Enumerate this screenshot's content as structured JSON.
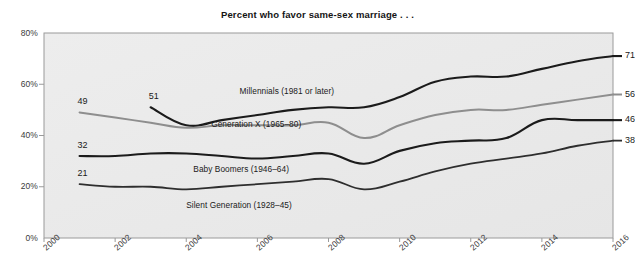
{
  "chart_data": {
    "type": "line",
    "title": "Percent who favor same-sex marriage . . .",
    "xlabel": "",
    "ylabel": "",
    "xlim": [
      2000,
      2016
    ],
    "ylim": [
      0,
      80
    ],
    "grid": false,
    "legend_position": "inline-labels",
    "x_ticks": [
      "2000",
      "2002",
      "2004",
      "2006",
      "2008",
      "2010",
      "2012",
      "2014",
      "2016"
    ],
    "x_tick_values": [
      2000,
      2002,
      2004,
      2006,
      2008,
      2010,
      2012,
      2014,
      2016
    ],
    "y_ticks": [
      "0%",
      "20%",
      "40%",
      "60%",
      "80%"
    ],
    "y_tick_values": [
      0,
      20,
      40,
      60,
      80
    ],
    "series": [
      {
        "name": "Millennials (1981 or later)",
        "label": "Millennials (1981 or later)",
        "color": "#1b1b1b",
        "width": 2.1,
        "start_label": "51",
        "end_label": "71",
        "x": [
          2003,
          2004,
          2005,
          2006,
          2007,
          2008,
          2009,
          2010,
          2011,
          2012,
          2013,
          2014,
          2015,
          2016
        ],
        "values": [
          51,
          44,
          46,
          48,
          50,
          51,
          51,
          55,
          61,
          63,
          63,
          66,
          69,
          71
        ]
      },
      {
        "name": "Generation X (1965-80)",
        "label": "Generation X (1965–80)",
        "color": "#8e8e8e",
        "width": 2.0,
        "start_label": "49",
        "end_label": "56",
        "x": [
          2001,
          2002,
          2003,
          2004,
          2005,
          2006,
          2007,
          2008,
          2009,
          2010,
          2011,
          2012,
          2013,
          2014,
          2015,
          2016
        ],
        "values": [
          49,
          47,
          45,
          43,
          44,
          44,
          44,
          45,
          39,
          44,
          48,
          50,
          50,
          52,
          54,
          56
        ]
      },
      {
        "name": "Baby Boomers (1946-64)",
        "label": "Baby Boomers (1946–64)",
        "color": "#1b1b1b",
        "width": 2.1,
        "start_label": "32",
        "end_label": "46",
        "x": [
          2001,
          2002,
          2003,
          2004,
          2005,
          2006,
          2007,
          2008,
          2009,
          2010,
          2011,
          2012,
          2013,
          2014,
          2015,
          2016
        ],
        "values": [
          32,
          32,
          33,
          33,
          32,
          31,
          32,
          33,
          29,
          34,
          37,
          38,
          39,
          46,
          46,
          46
        ]
      },
      {
        "name": "Silent Generation (1928-45)",
        "label": "Silent Generation (1928–45)",
        "color": "#2e2e2e",
        "width": 1.8,
        "start_label": "21",
        "end_label": "38",
        "x": [
          2001,
          2002,
          2003,
          2004,
          2005,
          2006,
          2007,
          2008,
          2009,
          2010,
          2011,
          2012,
          2013,
          2014,
          2015,
          2016
        ],
        "values": [
          21,
          20,
          20,
          19,
          20,
          21,
          22,
          23,
          19,
          22,
          26,
          29,
          31,
          33,
          36,
          38
        ]
      }
    ],
    "inline_labels": [
      {
        "text": "Millennials (1981 or later)",
        "x": 2005.5,
        "y": 57.5
      },
      {
        "text": "Generation X (1965–80)",
        "x": 2004.7,
        "y": 44.5
      },
      {
        "text": "Baby Boomers (1946–64)",
        "x": 2004.2,
        "y": 27.0
      },
      {
        "text": "Silent Generation (1928–45)",
        "x": 2004.0,
        "y": 13.0
      }
    ]
  },
  "style": {
    "plot_background": "#ebebeb",
    "page_background": "#ffffff",
    "axis_color": "#9a9a9a",
    "tick_text_color": "#3a3a3a"
  }
}
